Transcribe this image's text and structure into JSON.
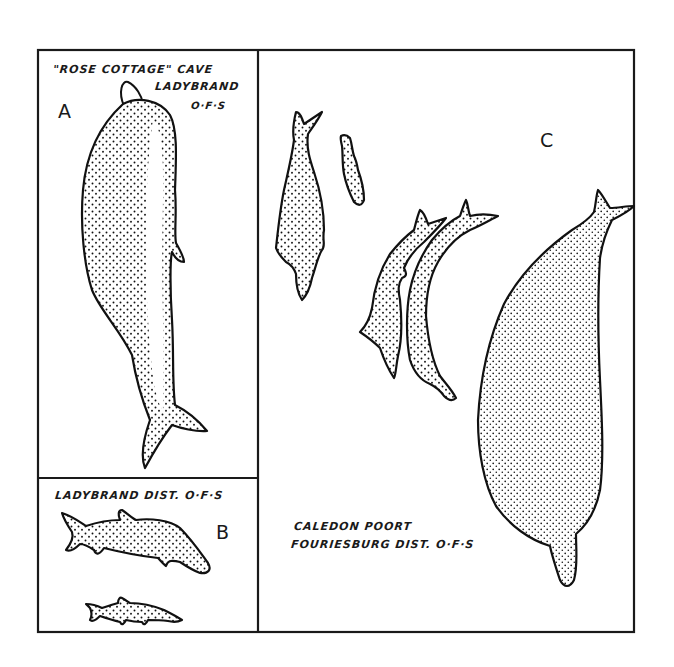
{
  "figure": {
    "panels": [
      {
        "id": "A",
        "letter": "A",
        "caption_lines": [
          "\"ROSE COTTAGE\" CAVE",
          "LADYBRAND",
          "O·F·S"
        ],
        "figures": 1
      },
      {
        "id": "B",
        "letter": "B",
        "caption_lines": [
          "LADYBRAND DIST. O·F·S"
        ],
        "figures": 2
      },
      {
        "id": "C",
        "letter": "C",
        "caption_lines": [
          "CALEDON POORT",
          "FOURIESBURG DIST. O·F·S"
        ],
        "figures": 5
      }
    ],
    "style": {
      "ink_color": "#111111",
      "paper_color": "#ffffff"
    }
  }
}
